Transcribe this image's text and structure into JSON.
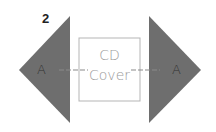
{
  "step_number": "2",
  "left_flap": {
    "label": "A",
    "fill": "#6e6e6e"
  },
  "right_flap": {
    "label": "A",
    "fill": "#6e6e6e"
  },
  "center_box": {
    "line1": "CD",
    "line2": "Cover",
    "stroke": "#b5b5b5"
  },
  "fold_line_color": "#8a8a8a"
}
